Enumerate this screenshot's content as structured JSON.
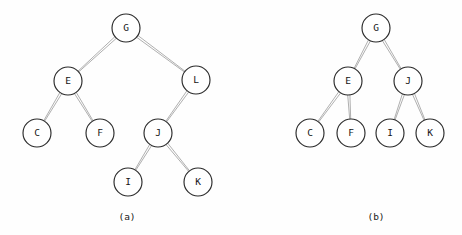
{
  "figure": {
    "background_color": "#fefefe",
    "node_fill_color": "#ffffff",
    "node_stroke_color": "#2a2a2a",
    "edge_color": "#1a1a1a",
    "label_color": "#151515",
    "node_radius": 14,
    "diagrams": [
      {
        "id": "a",
        "caption": "(a)",
        "caption_x": 127,
        "caption_y": 217,
        "description": "binary tree with skewed right subtree",
        "nodes": [
          {
            "id": "G",
            "label": "G",
            "x": 126,
            "y": 28,
            "level": 0
          },
          {
            "id": "E",
            "label": "E",
            "x": 68,
            "y": 81,
            "level": 1
          },
          {
            "id": "L",
            "label": "L",
            "x": 196,
            "y": 80,
            "level": 1
          },
          {
            "id": "C",
            "label": "C",
            "x": 37,
            "y": 133,
            "level": 2
          },
          {
            "id": "F",
            "label": "F",
            "x": 100,
            "y": 133,
            "level": 2
          },
          {
            "id": "J",
            "label": "J",
            "x": 158,
            "y": 133,
            "level": 2
          },
          {
            "id": "I",
            "label": "I",
            "x": 128,
            "y": 182,
            "level": 3
          },
          {
            "id": "K",
            "label": "K",
            "x": 198,
            "y": 182,
            "level": 3
          }
        ],
        "edges": [
          {
            "from": "G",
            "to": "E"
          },
          {
            "from": "G",
            "to": "L"
          },
          {
            "from": "E",
            "to": "C"
          },
          {
            "from": "E",
            "to": "F"
          },
          {
            "from": "L",
            "to": "J"
          },
          {
            "from": "J",
            "to": "I"
          },
          {
            "from": "J",
            "to": "K"
          }
        ]
      },
      {
        "id": "b",
        "caption": "(b)",
        "caption_x": 376,
        "caption_y": 217,
        "description": "complete balanced binary tree",
        "nodes": [
          {
            "id": "G",
            "label": "G",
            "x": 376,
            "y": 28,
            "level": 0
          },
          {
            "id": "E",
            "label": "E",
            "x": 348,
            "y": 81,
            "level": 1
          },
          {
            "id": "J",
            "label": "J",
            "x": 408,
            "y": 81,
            "level": 1
          },
          {
            "id": "C",
            "label": "C",
            "x": 310,
            "y": 133,
            "level": 2
          },
          {
            "id": "F",
            "label": "F",
            "x": 351,
            "y": 133,
            "level": 2
          },
          {
            "id": "I",
            "label": "I",
            "x": 390,
            "y": 133,
            "level": 2
          },
          {
            "id": "K",
            "label": "K",
            "x": 430,
            "y": 133,
            "level": 2
          }
        ],
        "edges": [
          {
            "from": "G",
            "to": "E"
          },
          {
            "from": "G",
            "to": "J"
          },
          {
            "from": "E",
            "to": "C"
          },
          {
            "from": "E",
            "to": "F"
          },
          {
            "from": "J",
            "to": "I"
          },
          {
            "from": "J",
            "to": "K"
          }
        ]
      }
    ]
  }
}
